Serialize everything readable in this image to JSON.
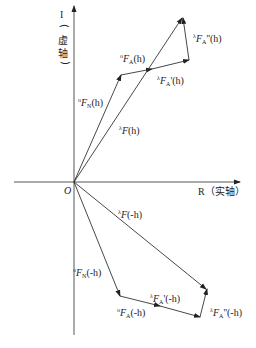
{
  "diagram": {
    "type": "argand-vector-diagram",
    "axes": {
      "imaginary": {
        "label_symbol": "I",
        "label_cn_paren_open": "(",
        "label_cn_1": "虚",
        "label_cn_2": "轴",
        "label_cn_paren_close": ")"
      },
      "real": {
        "label": "R（实轴）"
      },
      "origin_label": "O"
    },
    "vectors_h": [
      {
        "id": "F0N_h",
        "sup": "o",
        "base": "F",
        "sub": "N",
        "prime": "",
        "arg": "(h)"
      },
      {
        "id": "F0A_h",
        "sup": "o",
        "base": "F",
        "sub": "A",
        "prime": "",
        "arg": "(h)"
      },
      {
        "id": "FlA1_h",
        "sup": "λ",
        "base": "F",
        "sub": "A",
        "prime": "'",
        "arg": "(h)"
      },
      {
        "id": "FlA2_h",
        "sup": "λ",
        "base": "F",
        "sub": "A",
        "prime": "''",
        "arg": "(h)"
      },
      {
        "id": "Fl_h",
        "sup": "λ",
        "base": "F",
        "sub": "",
        "prime": "",
        "arg": "(h)"
      }
    ],
    "vectors_minus_h": [
      {
        "id": "F0N_mh",
        "sup": "o",
        "base": "F",
        "sub": "N",
        "prime": "",
        "arg": "(-h)"
      },
      {
        "id": "F0A_mh",
        "sup": "o",
        "base": "F",
        "sub": "A",
        "prime": "",
        "arg": "(-h)"
      },
      {
        "id": "FlA1_mh",
        "sup": "λ",
        "base": "F",
        "sub": "A",
        "prime": "'",
        "arg": "(-h)"
      },
      {
        "id": "FlA2_mh",
        "sup": "λ",
        "base": "F",
        "sub": "A",
        "prime": "''",
        "arg": "(-h)"
      },
      {
        "id": "Fl_mh",
        "sup": "λ",
        "base": "F",
        "sub": "",
        "prime": "",
        "arg": "(-h)"
      }
    ],
    "colors": {
      "line": "#333333",
      "text": "#222222",
      "background": "#ffffff"
    }
  }
}
